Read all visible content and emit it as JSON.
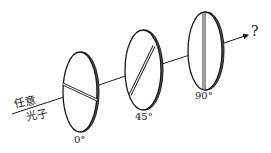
{
  "diagram": {
    "input_label_line1": "任意",
    "input_label_line2": "光子",
    "output_label": "?",
    "polarizers": [
      {
        "angle_label": "0°",
        "angle": 0
      },
      {
        "angle_label": "45°",
        "angle": 45
      },
      {
        "angle_label": "90°",
        "angle": 90
      }
    ],
    "colors": {
      "stroke": "#1a1a1a",
      "rim": "#555555",
      "background": "#ffffff"
    }
  }
}
